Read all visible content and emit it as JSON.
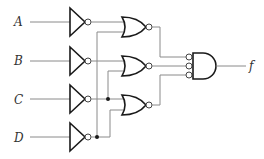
{
  "diagram": {
    "type": "logic-circuit",
    "inputs": [
      {
        "id": "A",
        "label": "A"
      },
      {
        "id": "B",
        "label": "B"
      },
      {
        "id": "C",
        "label": "C"
      },
      {
        "id": "D",
        "label": "D"
      }
    ],
    "output": {
      "id": "f",
      "label": "f"
    },
    "gates": [
      {
        "id": "inv-a",
        "type": "NOT",
        "inputs": [
          "A"
        ]
      },
      {
        "id": "inv-b",
        "type": "NOT",
        "inputs": [
          "B"
        ]
      },
      {
        "id": "inv-c",
        "type": "NOT",
        "inputs": [
          "C"
        ]
      },
      {
        "id": "inv-d",
        "type": "NOT",
        "inputs": [
          "D"
        ]
      },
      {
        "id": "nor-1",
        "type": "NOR",
        "inputs": [
          "inv-a",
          "inv-d"
        ]
      },
      {
        "id": "nor-2",
        "type": "NOR",
        "inputs": [
          "inv-b",
          "inv-c"
        ]
      },
      {
        "id": "nor-3",
        "type": "NOR",
        "inputs": [
          "inv-c",
          "inv-d"
        ]
      },
      {
        "id": "and-out",
        "type": "AND",
        "inverted_inputs": true,
        "inputs": [
          "nor-1",
          "nor-2",
          "nor-3"
        ],
        "output": "f"
      }
    ]
  }
}
